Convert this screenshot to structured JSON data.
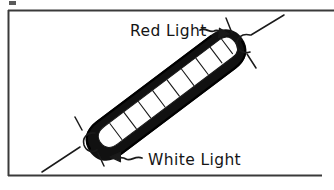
{
  "figure": {
    "background_color": "#ffffff",
    "ink_color": "#151515",
    "frame": {
      "name": "border-frame",
      "style": "thin rectangle, open on right edge",
      "color": "#3a3a3a",
      "left": 8,
      "top": 10,
      "right": 322,
      "bottom": 176
    },
    "corner_mark": {
      "name": "top-left-tick-mark",
      "x": 9,
      "y": 1,
      "width": 7,
      "height": 4
    },
    "tube": {
      "name": "fluorescent-tube",
      "description": "thick black elongated capsule outline with white inner channel",
      "angle_degrees": -37,
      "center_x": 166,
      "center_y": 95,
      "length": 190,
      "thickness": 42,
      "outline_color": "#111111",
      "interior_color": "#ffffff",
      "tick_count": 9
    },
    "bursts": [
      {
        "name": "light-burst-red-end",
        "position": "top-right",
        "cap_x": 245,
        "cap_y": 42,
        "ray_count": 3
      },
      {
        "name": "light-burst-white-end",
        "position": "bottom-left",
        "cap_x": 89,
        "cap_y": 142,
        "ray_count": 3
      }
    ],
    "labels": [
      {
        "name": "red-light-label",
        "text": "Red Light",
        "x": 130,
        "y": 36,
        "arrow": {
          "name": "red-light-arrow",
          "direction": "right",
          "style": "squiggle"
        }
      },
      {
        "name": "white-light-label",
        "text": "White Light",
        "x": 148,
        "y": 165,
        "arrow": {
          "name": "white-light-arrow",
          "direction": "left",
          "style": "squiggle"
        }
      }
    ]
  }
}
